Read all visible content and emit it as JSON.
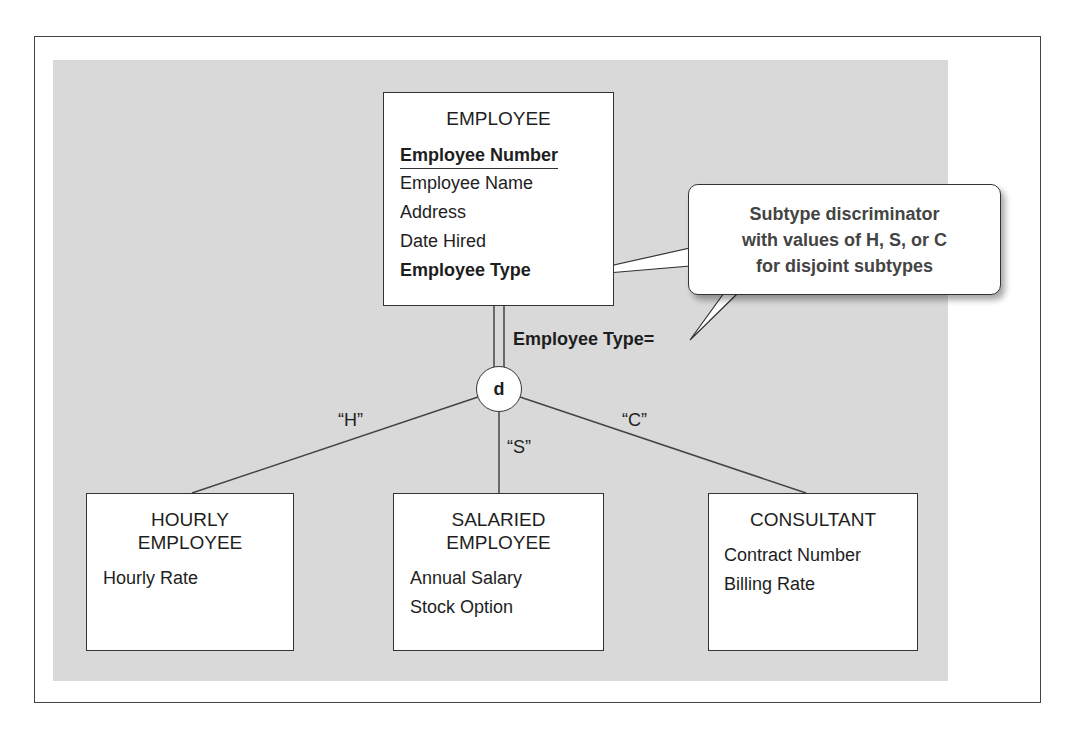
{
  "supertype": {
    "name": "EMPLOYEE",
    "identifier": "Employee Number",
    "attributes": [
      "Employee Name",
      "Address",
      "Date Hired"
    ],
    "discriminator_attribute": "Employee Type"
  },
  "discriminator": {
    "label": "Employee Type=",
    "symbol": "d"
  },
  "branch_labels": {
    "hourly": "“H”",
    "salaried": "“S”",
    "consultant": "“C”"
  },
  "subtypes": [
    {
      "name_line1": "HOURLY",
      "name_line2": "EMPLOYEE",
      "attributes": [
        "Hourly Rate"
      ]
    },
    {
      "name_line1": "SALARIED",
      "name_line2": "EMPLOYEE",
      "attributes": [
        "Annual Salary",
        "Stock Option"
      ]
    },
    {
      "name_line1": "CONSULTANT",
      "attributes": [
        "Contract Number",
        "Billing Rate"
      ]
    }
  ],
  "callout": {
    "line1": "Subtype discriminator",
    "line2": "with values of H, S, or C",
    "line3": "for disjoint subtypes"
  }
}
